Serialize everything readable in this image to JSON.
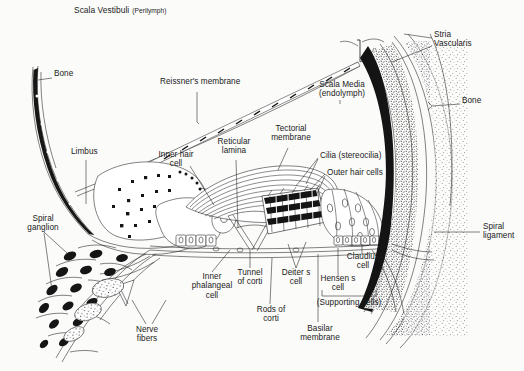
{
  "figure": {
    "background_color": "#fbfbf9",
    "ink_color": "#1a1a1a",
    "width": 524,
    "height": 371
  },
  "labels": {
    "scala_vestibuli": {
      "text": "Scala Vestibuli",
      "sub": "(Perilymph)",
      "x": 74,
      "y": 7
    },
    "bone_left": {
      "text": "Bone",
      "x": 54,
      "y": 74
    },
    "reissners_membrane": {
      "text": "Reissner's membrane",
      "x": 160,
      "y": 82
    },
    "scala_media": {
      "line1": "Scala Media",
      "line2": "(endolymph)",
      "x": 322,
      "y": 84
    },
    "stria_vascularis": {
      "line1": "Stria",
      "line2": "Vascularis",
      "x": 434,
      "y": 33
    },
    "bone_right": {
      "text": "Bone",
      "x": 462,
      "y": 99
    },
    "limbus": {
      "text": "Limbus",
      "x": 71,
      "y": 150
    },
    "inner_hair_cell": {
      "line1": "Inner hair",
      "line2": "cell",
      "x": 156,
      "y": 153
    },
    "reticular_lamina": {
      "line1": "Reticular",
      "line2": "lamina",
      "x": 217,
      "y": 141
    },
    "tectorial_membrane": {
      "line1": "Tectorial",
      "line2": "membrane",
      "x": 271,
      "y": 128
    },
    "cilia_stereocilia": {
      "text": "Cilia (stereocilia)",
      "x": 320,
      "y": 154
    },
    "outer_hair_cells": {
      "text": "Outer hair cells",
      "x": 327,
      "y": 171
    },
    "spiral_ganglion": {
      "line1": "Spiral",
      "line2": "ganglion",
      "x": 22,
      "y": 218
    },
    "spiral_ligament": {
      "line1": "Spiral",
      "line2": "ligament",
      "x": 483,
      "y": 226
    },
    "claudius_cell": {
      "line1": "Claudius",
      "line2": "cell",
      "x": 350,
      "y": 256
    },
    "deiters_cell": {
      "line1": "Deiter s",
      "line2": "cell",
      "x": 281,
      "y": 272
    },
    "hensens_cell": {
      "line1": "Hensen s",
      "line2": "cell",
      "x": 325,
      "y": 278
    },
    "tunnel_of_corti": {
      "line1": "Tunnel",
      "line2": "of corti",
      "x": 234,
      "y": 272
    },
    "supporting_cells": {
      "text": "(Supporting cells)",
      "x": 334,
      "y": 300
    },
    "inner_phalangeal_cell": {
      "line1": "Inner",
      "line2": "phalangeal",
      "line3": "cell",
      "x": 194,
      "y": 276
    },
    "rods_of_corti": {
      "line1": "Rods of",
      "line2": "corti",
      "x": 256,
      "y": 308
    },
    "nerve_fibers": {
      "line1": "Nerve",
      "line2": "fibers",
      "x": 133,
      "y": 328
    },
    "basilar_membrane": {
      "line1": "Basilar",
      "line2": "membrane",
      "x": 305,
      "y": 327
    }
  },
  "structures": {
    "scala_vestibuli": "upper perilymph-filled chamber",
    "scala_media": "triangular endolymph-filled cochlear duct",
    "reissners_membrane": "hatched diagonal membrane roofing the scala media",
    "basilar_membrane": "thin horizontal fibrous membrane floor",
    "limbus": "stippled teardrop body on the medial wall",
    "stria_vascularis": "dark vascular strip on the lateral wall",
    "spiral_ligament": "stippled lateral connective tissue",
    "spiral_ganglion": "cluster of dark bipolar neuron cell bodies",
    "tectorial_membrane": "striated gelatinous flap overhanging hair cells",
    "outer_hair_cells": "dark banded cell group on the lateral tunnel side",
    "inner_hair_cell": "single flask-shaped cell medial to the tunnel",
    "tunnel_of_corti": "triangular space between inner and outer rods",
    "supporting_cells_bracket_covers": [
      "Hensen s cell",
      "Claudius cell"
    ]
  }
}
